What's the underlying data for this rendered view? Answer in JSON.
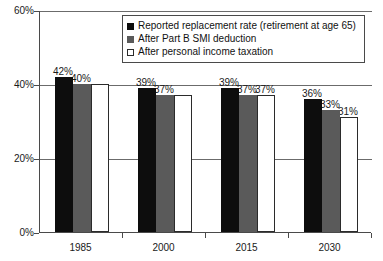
{
  "chart_data": {
    "type": "bar",
    "title": "",
    "subtitle": "",
    "xlabel": "",
    "ylabel": "",
    "categories": [
      "1985",
      "2000",
      "2015",
      "2030"
    ],
    "series": [
      {
        "name": "Reported replacement rate (retirement at age 65)",
        "color": "#0d0d0d",
        "values": [
          42,
          39,
          39,
          36
        ],
        "labels": [
          "42%",
          "39%",
          "39%",
          "36%"
        ]
      },
      {
        "name": "After Part B SMI deduction",
        "color": "#5a5a5a",
        "values": [
          40,
          37,
          37,
          33
        ],
        "labels": [
          "40%",
          "37%",
          "37%",
          "33%"
        ]
      },
      {
        "name": "After personal income taxation",
        "color": "#ffffff",
        "values": [
          40,
          37,
          37,
          31
        ],
        "labels": [
          "",
          "",
          "37%",
          "31%"
        ]
      }
    ],
    "ylim": [
      0,
      60
    ],
    "yticks": [
      0,
      20,
      40,
      60
    ],
    "ytick_labels": [
      "0%",
      "20%",
      "40%",
      "60%"
    ],
    "grid": true,
    "legend_position": "top-center",
    "value_unit": "%"
  },
  "legend": {
    "entries": [
      "Reported replacement rate (retirement at age 65)",
      "After Part B SMI deduction",
      "After personal income taxation"
    ]
  }
}
